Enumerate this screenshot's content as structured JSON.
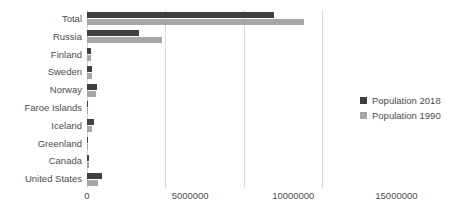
{
  "chart_data": {
    "type": "bar",
    "orientation": "horizontal",
    "title": "",
    "subtitle": "",
    "xlabel": "",
    "ylabel": "",
    "grid": true,
    "legend_position": "right",
    "xlim": [
      0,
      17500000
    ],
    "xticks": [
      0,
      5000000,
      10000000,
      15000000
    ],
    "xtick_labels": [
      "0",
      "5000000",
      "10000000",
      "15000000"
    ],
    "categories": [
      "Total",
      "Russia",
      "Finland",
      "Sweden",
      "Norway",
      "Faroe Islands",
      "Iceland",
      "Greenland",
      "Canada",
      "United States"
    ],
    "series": [
      {
        "name": "Population 2018",
        "color": "#404040",
        "values": [
          9070000,
          2510000,
          185000,
          250000,
          480000,
          51000,
          355000,
          56000,
          115000,
          740000
        ]
      },
      {
        "name": "Population 1990",
        "color": "#a6a6a6",
        "values": [
          10530000,
          3640000,
          200000,
          260000,
          440000,
          47000,
          255000,
          55000,
          95000,
          550000
        ]
      }
    ]
  },
  "legend": {
    "items": [
      {
        "label": "Population 2018",
        "color": "#404040"
      },
      {
        "label": "Population 1990",
        "color": "#a6a6a6"
      }
    ]
  },
  "colors": {
    "series_2018": "#404040",
    "series_1990": "#a6a6a6",
    "gridline": "#d9d9d9",
    "text": "#4d4d4d",
    "background": "#ffffff"
  }
}
